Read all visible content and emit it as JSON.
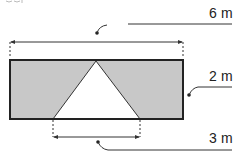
{
  "diagram": {
    "type": "geometry-figure",
    "shapes": {
      "rectangle": {
        "fill": "#c8c8c8",
        "stroke": "#222222",
        "width_label": "6 m",
        "height_label": "2 m"
      },
      "triangle": {
        "fill": "#ffffff",
        "base_label": "3 m"
      }
    },
    "labels": {
      "width": "6 m",
      "height": "2 m",
      "triangle_base": "3 m"
    },
    "top_fragment": "fig"
  }
}
